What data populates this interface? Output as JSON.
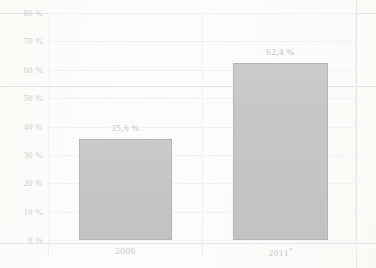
{
  "chart_data": {
    "type": "bar",
    "title": "",
    "subtitle": "",
    "xlabel": "",
    "ylabel": "",
    "categories": [
      "2006",
      "2011*"
    ],
    "values": [
      35.6,
      62.4
    ],
    "data_labels": [
      "35,6 %",
      "62,4 %"
    ],
    "ylim": [
      0,
      80
    ],
    "ytick_values": [
      0,
      10,
      20,
      30,
      40,
      50,
      60,
      70,
      80
    ],
    "ytick_labels": [
      "0 %",
      "10 %",
      "20 %",
      "30 %",
      "40 %",
      "50 %",
      "60 %",
      "70 %",
      "80 %"
    ],
    "grid": true,
    "legend": "none",
    "series": [
      {
        "name": "",
        "values": [
          35.6,
          62.4
        ]
      }
    ],
    "colors": {
      "bar_fill": "#c6c6c6",
      "bar_border": "#b4b4b4",
      "gridline": "#f2f2f0",
      "axis": "#d4d8dd",
      "label_text": "#c4c6c3",
      "background": "#fcfcfb"
    },
    "footnote_marker": "*"
  }
}
